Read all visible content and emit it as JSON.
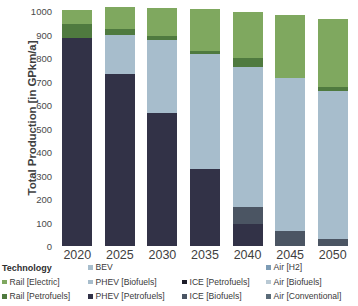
{
  "chart_data": {
    "type": "bar",
    "stacked": true,
    "title": "",
    "xlabel": "",
    "ylabel": "Total Production [in GPkm/a]",
    "categories": [
      "2020",
      "2025",
      "2030",
      "2035",
      "2040",
      "2045",
      "2050"
    ],
    "ylim": [
      0,
      1000
    ],
    "yticks": [
      0,
      100,
      200,
      300,
      400,
      500,
      600,
      700,
      800,
      900,
      1000
    ],
    "grid": false,
    "legend_position": "bottom",
    "legend_title": "Technology",
    "series": [
      {
        "name": "ICE [Petrofuels]",
        "color": "#323247",
        "values": [
          885,
          733,
          565,
          328,
          95,
          0,
          0
        ]
      },
      {
        "name": "ICE [Biofuels]",
        "color": "#4b5563",
        "values": [
          0,
          0,
          0,
          0,
          70,
          65,
          30
        ]
      },
      {
        "name": "Air [Biofuels]",
        "color": "#a7bdcc",
        "values": [
          0,
          165,
          310,
          490,
          595,
          650,
          630
        ]
      },
      {
        "name": "Rail [Petrofuels]",
        "color": "#4f7a3f",
        "values": [
          60,
          27,
          20,
          12,
          40,
          0,
          15
        ]
      },
      {
        "name": "Rail [Electric]",
        "color": "#7fa85f",
        "values": [
          60,
          90,
          120,
          180,
          195,
          270,
          290
        ]
      }
    ],
    "bar_totals": [
      1005,
      1015,
      1015,
      1010,
      995,
      985,
      965
    ]
  },
  "legend": {
    "title": "Technology",
    "columns": [
      {
        "items": [
          {
            "label": "Rail [Electric]",
            "color": "#7fa85f"
          },
          {
            "label": "Rail [Petrofuels]",
            "color": "#4f7a3f"
          }
        ]
      },
      {
        "items": [
          {
            "label": "BEV",
            "color": "#a7bdcc"
          },
          {
            "label": "PHEV [Biofuels]",
            "color": "#a7bdcc"
          },
          {
            "label": "PHEV [Petrofuels]",
            "color": "#323247"
          }
        ]
      },
      {
        "items": [
          {
            "label": "ICE [Petrofuels]",
            "color": "#1c1c28"
          },
          {
            "label": "ICE [Biofuels]",
            "color": "#4b5563"
          }
        ]
      },
      {
        "items": [
          {
            "label": "Air [H2]",
            "color": "#7d9cb5"
          },
          {
            "label": "Air [Biofuels]",
            "color": "#b9c9d4"
          },
          {
            "label": "Air [Conventional]",
            "color": "#5a6b78"
          }
        ]
      }
    ]
  }
}
